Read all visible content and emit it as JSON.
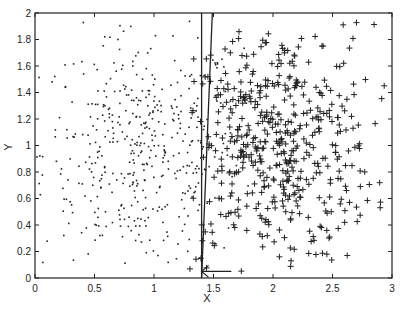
{
  "chart_data": {
    "type": "scatter",
    "title": "",
    "xlabel": "X",
    "ylabel": "Y",
    "xlim": [
      0,
      3
    ],
    "ylim": [
      0,
      2
    ],
    "xticks": [
      "0",
      "0.5",
      "1",
      "1.5",
      "2",
      "2.5",
      "3"
    ],
    "yticks": [
      "0",
      "0.2",
      "0.4",
      "0.6",
      "0.8",
      "1",
      "1.2",
      "1.4",
      "1.6",
      "1.8",
      "2"
    ],
    "grid": false,
    "legend": null,
    "series": [
      {
        "name": "class-dot",
        "marker": "dot",
        "approx_count": 450,
        "x_range": [
          0.0,
          1.8
        ],
        "y_range": [
          0.1,
          1.95
        ],
        "center": [
          0.9,
          0.95
        ]
      },
      {
        "name": "class-plus",
        "marker": "plus",
        "approx_count": 500,
        "x_range": [
          1.3,
          2.95
        ],
        "y_range": [
          0.05,
          1.95
        ],
        "center": [
          2.0,
          1.0
        ]
      }
    ],
    "annotations": [
      {
        "type": "line",
        "label": "decision-boundary-vertical",
        "from": [
          1.4,
          0
        ],
        "to": [
          1.4,
          2
        ]
      },
      {
        "type": "line",
        "label": "decision-boundary-slanted",
        "from": [
          1.4,
          0
        ],
        "to": [
          1.49,
          2
        ]
      },
      {
        "type": "arrow",
        "label": "left-arrow",
        "from": [
          1.65,
          0.05
        ],
        "to": [
          1.4,
          0.05
        ]
      }
    ]
  },
  "plot": {
    "colors": {
      "ink": "#222222",
      "background": "#ffffff"
    },
    "frame": {
      "left": 35,
      "right": 392,
      "top": 13,
      "bottom": 278
    }
  }
}
